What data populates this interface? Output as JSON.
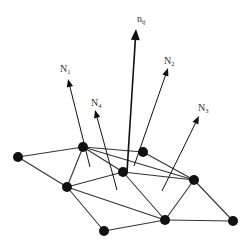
{
  "diagram": {
    "type": "mesh-normals",
    "colors": {
      "line": "#333333",
      "node": "#111111",
      "arrow": "#111111",
      "label": "#333333"
    },
    "nodes": [
      {
        "id": "A",
        "x": 18,
        "y": 157
      },
      {
        "id": "B",
        "x": 83,
        "y": 147
      },
      {
        "id": "C",
        "x": 143,
        "y": 152
      },
      {
        "id": "D",
        "x": 123,
        "y": 172
      },
      {
        "id": "E",
        "x": 67,
        "y": 187
      },
      {
        "id": "F",
        "x": 194,
        "y": 180
      },
      {
        "id": "G",
        "x": 165,
        "y": 220
      },
      {
        "id": "H",
        "x": 104,
        "y": 231
      },
      {
        "id": "I",
        "x": 233,
        "y": 221
      }
    ],
    "edges": [
      [
        "A",
        "B"
      ],
      [
        "A",
        "E"
      ],
      [
        "B",
        "E"
      ],
      [
        "B",
        "C"
      ],
      [
        "B",
        "D"
      ],
      [
        "B",
        "F"
      ],
      [
        "C",
        "F"
      ],
      [
        "D",
        "F"
      ],
      [
        "E",
        "D"
      ],
      [
        "E",
        "G"
      ],
      [
        "D",
        "G"
      ],
      [
        "E",
        "H"
      ],
      [
        "H",
        "G"
      ],
      [
        "G",
        "F"
      ],
      [
        "G",
        "I"
      ],
      [
        "F",
        "I"
      ]
    ],
    "arrows": [
      {
        "id": "n_ij",
        "label_main": "n",
        "label_sub": "ij",
        "x1": 127,
        "y1": 172,
        "x2": 136,
        "y2": 29,
        "lx": 137,
        "ly": 22,
        "heavy": true
      },
      {
        "id": "N_1",
        "label_main": "N",
        "label_sub": "1",
        "x1": 90,
        "y1": 167,
        "x2": 68,
        "y2": 79,
        "lx": 60,
        "ly": 72,
        "heavy": false
      },
      {
        "id": "N_4",
        "label_main": "N",
        "label_sub": "4",
        "x1": 117,
        "y1": 190,
        "x2": 95,
        "y2": 110,
        "lx": 91,
        "ly": 106,
        "heavy": false
      },
      {
        "id": "N_2",
        "label_main": "N",
        "label_sub": "2",
        "x1": 134,
        "y1": 166,
        "x2": 168,
        "y2": 68,
        "lx": 164,
        "ly": 64,
        "heavy": false
      },
      {
        "id": "N_3",
        "label_main": "N",
        "label_sub": "3",
        "x1": 162,
        "y1": 191,
        "x2": 199,
        "y2": 116,
        "lx": 198,
        "ly": 111,
        "heavy": false
      }
    ]
  }
}
